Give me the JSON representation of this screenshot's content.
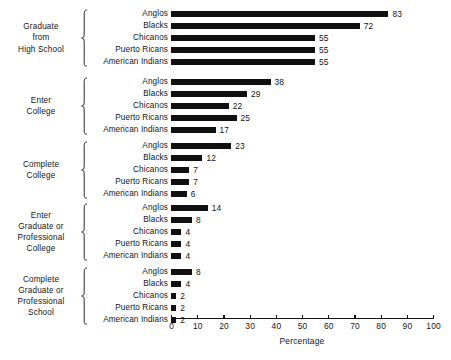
{
  "chart_data": {
    "type": "bar",
    "orientation": "horizontal",
    "title": "",
    "xlabel": "Percentage",
    "ylabel": "",
    "xlim": [
      0,
      100
    ],
    "x_ticks": [
      0,
      10,
      20,
      30,
      40,
      50,
      60,
      70,
      80,
      90,
      100
    ],
    "x_tick_labels": [
      "0",
      "10",
      "20",
      "30",
      "40",
      "50",
      "60",
      "70",
      "80",
      "90",
      "100"
    ],
    "grid": false,
    "legend": false,
    "bar_color": "#101010",
    "categories": [
      "Anglos",
      "Blacks",
      "Chicanos",
      "Puerto Ricans",
      "American Indians"
    ],
    "groups": [
      {
        "label": "Graduate from High School",
        "label_lines": [
          "Graduate",
          "from",
          "High School"
        ],
        "values": [
          83,
          72,
          55,
          55,
          55
        ]
      },
      {
        "label": "Enter College",
        "label_lines": [
          "Enter",
          "College"
        ],
        "values": [
          38,
          29,
          22,
          25,
          17
        ]
      },
      {
        "label": "Complete College",
        "label_lines": [
          "Complete",
          "College"
        ],
        "values": [
          23,
          12,
          7,
          7,
          6
        ]
      },
      {
        "label": "Enter Graduate or Professional College",
        "label_lines": [
          "Enter",
          "Graduate or",
          "Professional",
          "College"
        ],
        "values": [
          14,
          8,
          4,
          4,
          4
        ]
      },
      {
        "label": "Complete Graduate or Professional School",
        "label_lines": [
          "Complete",
          "Graduate or",
          "Professional",
          "School"
        ],
        "values": [
          8,
          4,
          2,
          2,
          2
        ]
      }
    ]
  }
}
